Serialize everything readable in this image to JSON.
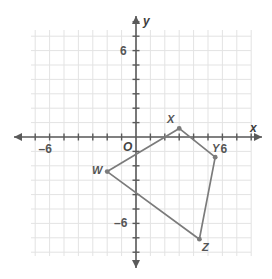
{
  "figure": {
    "background_color": "#ffffff",
    "grid_color": "#e3e3e3",
    "axis_color": "#5a5a5a",
    "shape_color": "#7b7b7b",
    "label_color": "#555555"
  },
  "axes": {
    "x_axis_label": "x",
    "y_axis_label": "y",
    "origin_label": "O",
    "x_ticks": [
      {
        "value": -6,
        "label": "–6"
      },
      {
        "value": 6,
        "label": "6"
      }
    ],
    "y_ticks": [
      {
        "value": 6,
        "label": "6"
      },
      {
        "value": -6,
        "label": "–6"
      }
    ],
    "x_range": [
      -7.3,
      7.9
    ],
    "y_range": [
      -8.4,
      8.4
    ],
    "grid": true,
    "grid_step": 1
  },
  "chart_data": {
    "type": "scatter",
    "xlabel": "x",
    "ylabel": "y",
    "xlim": [
      -7.3,
      7.9
    ],
    "ylim": [
      -8.4,
      8.4
    ],
    "grid": true,
    "legend": "none",
    "points": [
      {
        "name": "W",
        "x": -2,
        "y": -2.4,
        "label": "W",
        "label_side": "left"
      },
      {
        "name": "X",
        "x": 3,
        "y": 0.6,
        "label": "X",
        "label_side": "upper-left"
      },
      {
        "name": "Y",
        "x": 5.5,
        "y": -1.4,
        "label": "Y",
        "label_side": "upper-right"
      },
      {
        "name": "Z",
        "x": 4.4,
        "y": -7.1,
        "label": "Z",
        "label_side": "lower-right"
      }
    ],
    "polygon_order": [
      "W",
      "X",
      "Y",
      "Z"
    ],
    "closed": true
  }
}
